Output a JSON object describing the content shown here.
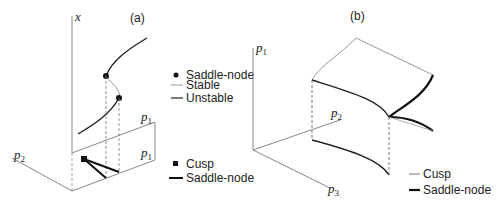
{
  "panel_a": {
    "label": "(a)",
    "axes": {
      "x": "x",
      "p1_top": "p",
      "p1_top_sub": "1",
      "p1_side": "p",
      "p1_side_sub": "1",
      "p2": "p",
      "p2_sub": "2"
    },
    "legend_top": [
      {
        "symbol": "filled-circle",
        "label": "Saddle-node"
      },
      {
        "symbol": "line-gray",
        "label": "Stable"
      },
      {
        "symbol": "line-dark",
        "label": "Unstable"
      }
    ],
    "legend_bottom": [
      {
        "symbol": "filled-square",
        "label": "Cusp"
      },
      {
        "symbol": "line-thick",
        "label": "Saddle-node"
      }
    ]
  },
  "panel_b": {
    "label": "(b)",
    "axes": {
      "p1": "p",
      "p1_sub": "1",
      "p2": "p",
      "p2_sub": "2",
      "p3": "p",
      "p3_sub": "3"
    },
    "legend": [
      {
        "symbol": "line-thin",
        "label": "Cusp"
      },
      {
        "symbol": "line-thick",
        "label": "Saddle-node"
      }
    ]
  },
  "colors": {
    "ink": "#222222",
    "gray": "#999999",
    "axis": "#888888"
  }
}
